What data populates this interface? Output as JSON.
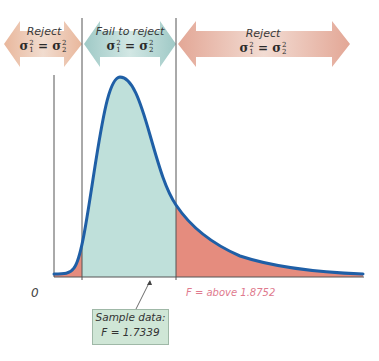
{
  "regions": [
    {
      "label": "Reject",
      "hypothesis": {
        "sigma": "σ",
        "lhs_sub": "1",
        "rhs_sub": "2",
        "power": "2",
        "op": "="
      },
      "color": "#e8c4b0"
    },
    {
      "label": "Fail to reject",
      "hypothesis": {
        "sigma": "σ",
        "lhs_sub": "1",
        "rhs_sub": "2",
        "power": "2",
        "op": "="
      },
      "color": "#b9d8d6"
    },
    {
      "label": "Reject",
      "hypothesis": {
        "sigma": "σ",
        "lhs_sub": "1",
        "rhs_sub": "2",
        "power": "2",
        "op": "="
      },
      "color": "#e7b7a8"
    }
  ],
  "axis": {
    "origin_label": "0"
  },
  "critical_value_label": "F = above 1.8752",
  "sample": {
    "line1": "Sample data:",
    "line2": "F = 1.7339"
  },
  "colors": {
    "curve": "#1f5fa6",
    "fail_to_reject_fill": "#bfe0da",
    "reject_fill": "#e58c7e",
    "critical_label": "#e07a8e",
    "sample_box": "#cfe6d6"
  }
}
